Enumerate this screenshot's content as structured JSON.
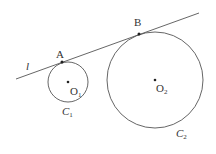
{
  "diagram": {
    "stroke_color": "#555555",
    "background": "#ffffff",
    "line": {
      "label": "l",
      "x1": 16,
      "y1": 79,
      "x2": 199,
      "y2": 13
    },
    "points": [
      {
        "label": "A",
        "x": 62,
        "y": 62
      },
      {
        "label": "B",
        "x": 139,
        "y": 34
      }
    ],
    "circles": [
      {
        "label": "C",
        "label_sub": "1",
        "center_label": "O",
        "center_sub": "1",
        "cx": 68,
        "cy": 82,
        "r": 20
      },
      {
        "label": "C",
        "label_sub": "2",
        "center_label": "O",
        "center_sub": "2",
        "cx": 155,
        "cy": 80,
        "r": 48
      }
    ]
  }
}
